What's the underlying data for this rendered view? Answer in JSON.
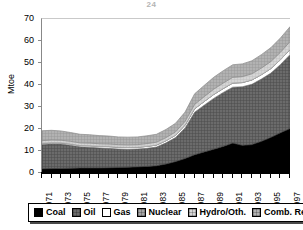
{
  "figure": {
    "title_remnant": "24",
    "background": "#ffffff"
  },
  "axes": {
    "ylabel": "Mtoe",
    "yticks": [
      0,
      10,
      20,
      30,
      40,
      50,
      60,
      70
    ],
    "xticks_labeled": [
      "1971",
      "1973",
      "1975",
      "1977",
      "1979",
      "1981",
      "1983",
      "1985",
      "1987",
      "1989",
      "1991",
      "1993",
      "1995",
      "1997"
    ]
  },
  "legend": {
    "items": [
      {
        "label": "Coal",
        "color": "#000000"
      },
      {
        "label": "Oil",
        "color": "#5a5a5a"
      },
      {
        "label": "Gas",
        "color": "#ffffff"
      },
      {
        "label": "Nuclear",
        "color": "#9a9a9a"
      },
      {
        "label": "Hydro/Oth.",
        "color": "#cfcfcf"
      },
      {
        "label": "Comb. Renew.",
        "color": "#a8a8a8"
      }
    ]
  },
  "chart_data": {
    "type": "area",
    "stacked": true,
    "title": "",
    "xlabel": "",
    "ylabel": "Mtoe",
    "ylim": [
      0,
      70
    ],
    "grid": false,
    "legend_position": "bottom",
    "x": [
      1971,
      1972,
      1973,
      1974,
      1975,
      1976,
      1977,
      1978,
      1979,
      1980,
      1981,
      1982,
      1983,
      1984,
      1985,
      1986,
      1987,
      1988,
      1989,
      1990,
      1991,
      1992,
      1993,
      1994,
      1995,
      1996,
      1997
    ],
    "categories": [
      "1971",
      "1972",
      "1973",
      "1974",
      "1975",
      "1976",
      "1977",
      "1978",
      "1979",
      "1980",
      "1981",
      "1982",
      "1983",
      "1984",
      "1985",
      "1986",
      "1987",
      "1988",
      "1989",
      "1990",
      "1991",
      "1992",
      "1993",
      "1994",
      "1995",
      "1996",
      "1997"
    ],
    "series": [
      {
        "name": "Coal",
        "color": "#000000",
        "values": [
          1.9,
          2.0,
          2.1,
          2.2,
          2.3,
          2.3,
          2.3,
          2.4,
          2.5,
          2.6,
          2.8,
          3.0,
          3.3,
          4.1,
          5.2,
          6.6,
          8.3,
          9.6,
          10.8,
          12.1,
          13.6,
          12.6,
          12.9,
          14.4,
          16.2,
          18.3,
          20.2
        ]
      },
      {
        "name": "Oil",
        "color": "#5a5a5a",
        "values": [
          11.1,
          11.3,
          11.1,
          10.4,
          9.6,
          9.4,
          9.1,
          8.8,
          8.4,
          8.2,
          8.1,
          8.2,
          8.5,
          9.6,
          10.9,
          13.9,
          19.3,
          21.2,
          23.1,
          24.5,
          25.4,
          26.6,
          27.4,
          28.3,
          29.2,
          31.0,
          33.6
        ]
      },
      {
        "name": "Gas",
        "color": "#ffffff",
        "values": [
          0.5,
          0.5,
          0.5,
          0.6,
          0.6,
          0.7,
          0.7,
          0.8,
          0.8,
          0.8,
          0.8,
          0.9,
          0.9,
          1.0,
          1.1,
          1.3,
          1.6,
          1.7,
          1.8,
          1.8,
          1.9,
          1.9,
          2.0,
          2.0,
          2.1,
          2.2,
          2.3
        ]
      },
      {
        "name": "Nuclear",
        "color": "#9a9a9a",
        "values": [
          0.0,
          0.0,
          0.0,
          0.0,
          0.0,
          0.0,
          0.0,
          0.0,
          0.0,
          0.0,
          0.0,
          0.0,
          0.0,
          0.0,
          0.0,
          0.0,
          0.0,
          0.0,
          0.0,
          0.0,
          0.0,
          0.0,
          0.0,
          0.0,
          0.0,
          0.0,
          0.0
        ]
      },
      {
        "name": "Hydro/Oth.",
        "color": "#cfcfcf",
        "values": [
          1.2,
          1.2,
          1.2,
          1.2,
          1.2,
          1.2,
          1.2,
          1.2,
          1.2,
          1.2,
          1.2,
          1.3,
          1.3,
          1.4,
          1.5,
          1.7,
          2.0,
          2.2,
          2.4,
          2.5,
          2.6,
          2.7,
          2.8,
          3.0,
          3.2,
          3.4,
          3.6
        ]
      },
      {
        "name": "Comb. Renew.",
        "color": "#a8a8a8",
        "values": [
          4.5,
          4.4,
          4.2,
          4.0,
          3.9,
          3.8,
          3.7,
          3.6,
          3.5,
          3.5,
          3.5,
          3.5,
          3.6,
          3.7,
          3.9,
          4.2,
          4.8,
          5.1,
          5.4,
          5.6,
          5.7,
          5.8,
          5.9,
          6.1,
          6.3,
          6.5,
          6.8
        ]
      }
    ],
    "totals": [
      19.2,
      19.4,
      19.1,
      18.4,
      17.6,
      17.4,
      17.0,
      16.8,
      16.4,
      16.3,
      16.4,
      16.9,
      17.6,
      19.8,
      22.6,
      27.7,
      36.0,
      39.8,
      43.5,
      46.5,
      49.2,
      49.6,
      51.0,
      53.8,
      57.0,
      61.4,
      66.5
    ]
  }
}
